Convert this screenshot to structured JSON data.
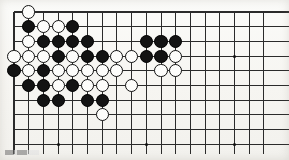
{
  "figure": {
    "board_label": "go-board",
    "caption_text": ""
  },
  "board": {
    "columns": 18,
    "rows": 10,
    "origin_x": 14,
    "origin_y": 12,
    "cell": 14.7,
    "line_color": "#2b2b2b",
    "board_color": "#f6f5f1",
    "stone_radius": 6.6,
    "star_radius": 1.6,
    "star_points": [
      {
        "col": 3,
        "row": 9
      },
      {
        "col": 9,
        "row": 9
      },
      {
        "col": 15,
        "row": 9
      },
      {
        "col": 15,
        "row": 3
      }
    ],
    "stones": [
      {
        "col": 1,
        "row": 0,
        "color": "white"
      },
      {
        "col": 1,
        "row": 1,
        "color": "black"
      },
      {
        "col": 2,
        "row": 1,
        "color": "white"
      },
      {
        "col": 3,
        "row": 1,
        "color": "white"
      },
      {
        "col": 4,
        "row": 1,
        "color": "black"
      },
      {
        "col": 1,
        "row": 2,
        "color": "white"
      },
      {
        "col": 2,
        "row": 2,
        "color": "black"
      },
      {
        "col": 3,
        "row": 2,
        "color": "black"
      },
      {
        "col": 4,
        "row": 2,
        "color": "black"
      },
      {
        "col": 5,
        "row": 2,
        "color": "black"
      },
      {
        "col": 9,
        "row": 2,
        "color": "black"
      },
      {
        "col": 10,
        "row": 2,
        "color": "black"
      },
      {
        "col": 11,
        "row": 2,
        "color": "black"
      },
      {
        "col": 0,
        "row": 3,
        "color": "white"
      },
      {
        "col": 1,
        "row": 3,
        "color": "white"
      },
      {
        "col": 2,
        "row": 3,
        "color": "white"
      },
      {
        "col": 3,
        "row": 3,
        "color": "black"
      },
      {
        "col": 4,
        "row": 3,
        "color": "white"
      },
      {
        "col": 5,
        "row": 3,
        "color": "black"
      },
      {
        "col": 6,
        "row": 3,
        "color": "black"
      },
      {
        "col": 7,
        "row": 3,
        "color": "white"
      },
      {
        "col": 8,
        "row": 3,
        "color": "white"
      },
      {
        "col": 9,
        "row": 3,
        "color": "black"
      },
      {
        "col": 10,
        "row": 3,
        "color": "black"
      },
      {
        "col": 11,
        "row": 3,
        "color": "white"
      },
      {
        "col": 0,
        "row": 4,
        "color": "black"
      },
      {
        "col": 1,
        "row": 4,
        "color": "white"
      },
      {
        "col": 2,
        "row": 4,
        "color": "black"
      },
      {
        "col": 3,
        "row": 4,
        "color": "white"
      },
      {
        "col": 4,
        "row": 4,
        "color": "white"
      },
      {
        "col": 5,
        "row": 4,
        "color": "white"
      },
      {
        "col": 6,
        "row": 4,
        "color": "white"
      },
      {
        "col": 7,
        "row": 4,
        "color": "white"
      },
      {
        "col": 10,
        "row": 4,
        "color": "white"
      },
      {
        "col": 11,
        "row": 4,
        "color": "white"
      },
      {
        "col": 1,
        "row": 5,
        "color": "black"
      },
      {
        "col": 2,
        "row": 5,
        "color": "black"
      },
      {
        "col": 3,
        "row": 5,
        "color": "white"
      },
      {
        "col": 4,
        "row": 5,
        "color": "black"
      },
      {
        "col": 5,
        "row": 5,
        "color": "white"
      },
      {
        "col": 6,
        "row": 5,
        "color": "white"
      },
      {
        "col": 8,
        "row": 5,
        "color": "white"
      },
      {
        "col": 2,
        "row": 6,
        "color": "black"
      },
      {
        "col": 3,
        "row": 6,
        "color": "black"
      },
      {
        "col": 5,
        "row": 6,
        "color": "black"
      },
      {
        "col": 6,
        "row": 6,
        "color": "black"
      },
      {
        "col": 6,
        "row": 7,
        "color": "white"
      }
    ]
  }
}
